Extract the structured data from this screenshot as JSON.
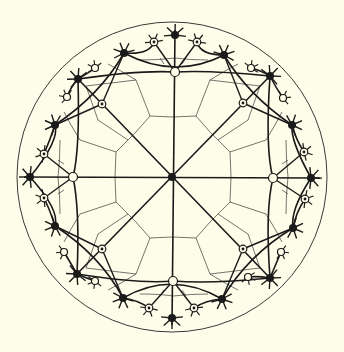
{
  "title": "Hyperbolic tiling in the Poincaré disk",
  "colors": {
    "background": "#fdfde9",
    "ink": "#1a1a1a",
    "thin_line": "#3a3a3a",
    "white_node": "#fdfde9"
  },
  "disk": {
    "cx": 172,
    "cy": 177,
    "r": 155
  },
  "center_node": {
    "x": 172,
    "y": 177,
    "type": "black"
  },
  "axis_lines": [
    {
      "x1": 175,
      "y1": 30,
      "x2": 172,
      "y2": 325
    },
    {
      "x1": 24,
      "y1": 177,
      "x2": 320,
      "y2": 178
    },
    {
      "x1": 78,
      "y1": 79,
      "x2": 270,
      "y2": 278
    },
    {
      "x1": 270,
      "y1": 76,
      "x2": 77,
      "y2": 274
    }
  ],
  "geodesic_arcs": [
    {
      "d": "M 124 53 Q 175 80 224 55"
    },
    {
      "d": "M 55 125 Q 100 95 124 53"
    },
    {
      "d": "M 224 55 Q 248 95 292 125"
    },
    {
      "d": "M 30 177 Q 60 140 55 125"
    },
    {
      "d": "M 292 125 Q 290 140 311 178"
    },
    {
      "d": "M 55 226 Q 60 210 30 177"
    },
    {
      "d": "M 311 178 Q 290 210 293 228"
    },
    {
      "d": "M 123 298 Q 100 255 55 226"
    },
    {
      "d": "M 293 228 Q 248 255 222 299"
    },
    {
      "d": "M 222 299 Q 172 270 123 298"
    },
    {
      "d": "M 78 79 Q 80 150 73 177"
    },
    {
      "d": "M 73 177 Q 80 210 77 274"
    },
    {
      "d": "M 270 76 Q 265 150 273 178"
    },
    {
      "d": "M 273 178 Q 265 210 270 278"
    },
    {
      "d": "M 78 79 Q 140 70 175 72"
    },
    {
      "d": "M 175 72 Q 210 70 270 76"
    },
    {
      "d": "M 77 274 Q 140 284 173 281"
    },
    {
      "d": "M 173 281 Q 210 284 270 278"
    },
    {
      "d": "M 154 42 Q 150 55 124 53"
    },
    {
      "d": "M 197 42 Q 200 55 224 55"
    },
    {
      "d": "M 44 154 Q 50 140 55 125"
    },
    {
      "d": "M 44 198 Q 50 210 55 226"
    },
    {
      "d": "M 304 152 Q 296 140 292 125"
    },
    {
      "d": "M 305 199 Q 296 212 293 228"
    },
    {
      "d": "M 149 308 Q 138 300 123 298"
    },
    {
      "d": "M 194 308 Q 206 300 222 299"
    },
    {
      "d": "M 95 68 Q 90 72 78 79"
    },
    {
      "d": "M 67 97 Q 70 88 78 79"
    },
    {
      "d": "M 251 68 Q 260 70 270 76"
    },
    {
      "d": "M 283 98 Q 276 88 270 76"
    },
    {
      "d": "M 64 252 Q 70 262 77 274"
    },
    {
      "d": "M 95 281 Q 86 278 77 274"
    },
    {
      "d": "M 248 277 Q 258 276 270 278"
    },
    {
      "d": "M 281 252 Q 276 264 270 278"
    }
  ],
  "spokes_to_ring": [
    {
      "x1": 102,
      "y1": 104,
      "x2": 124,
      "y2": 53
    },
    {
      "x1": 102,
      "y1": 104,
      "x2": 55,
      "y2": 125
    },
    {
      "x1": 243,
      "y1": 103,
      "x2": 224,
      "y2": 55
    },
    {
      "x1": 243,
      "y1": 103,
      "x2": 292,
      "y2": 125
    },
    {
      "x1": 102,
      "y1": 249,
      "x2": 55,
      "y2": 226
    },
    {
      "x1": 102,
      "y1": 249,
      "x2": 123,
      "y2": 298
    },
    {
      "x1": 243,
      "y1": 249,
      "x2": 293,
      "y2": 228
    },
    {
      "x1": 243,
      "y1": 249,
      "x2": 222,
      "y2": 299
    },
    {
      "x1": 175,
      "y1": 72,
      "x2": 154,
      "y2": 42
    },
    {
      "x1": 175,
      "y1": 72,
      "x2": 197,
      "y2": 42
    },
    {
      "x1": 73,
      "y1": 177,
      "x2": 44,
      "y2": 154
    },
    {
      "x1": 73,
      "y1": 177,
      "x2": 44,
      "y2": 198
    },
    {
      "x1": 273,
      "y1": 178,
      "x2": 304,
      "y2": 152
    },
    {
      "x1": 273,
      "y1": 178,
      "x2": 305,
      "y2": 199
    },
    {
      "x1": 173,
      "y1": 281,
      "x2": 149,
      "y2": 308
    },
    {
      "x1": 173,
      "y1": 281,
      "x2": 194,
      "y2": 308
    }
  ],
  "inner_cells": [
    {
      "d": "M 150 116 Q 172 118 196 116"
    },
    {
      "d": "M 150 116 L 136 132 M 196 116 L 210 132"
    },
    {
      "d": "M 116 152 Q 114 177 116 202"
    },
    {
      "d": "M 116 152 L 128 140 M 116 202 L 128 214"
    },
    {
      "d": "M 230 152 Q 232 177 230 202"
    },
    {
      "d": "M 230 152 L 218 140 M 230 202 L 218 214"
    },
    {
      "d": "M 150 238 Q 172 236 196 238"
    },
    {
      "d": "M 150 238 L 136 222 M 196 238 L 210 222"
    },
    {
      "d": "M 136 132 L 128 140 M 210 132 L 218 140 M 128 214 L 136 222 M 218 214 L 210 222"
    },
    {
      "d": "M 136 80 L 150 116 M 210 80 L 196 116"
    },
    {
      "d": "M 80 140 L 116 152 M 80 214 L 116 202"
    },
    {
      "d": "M 266 140 L 230 152 M 266 214 L 230 202"
    },
    {
      "d": "M 136 274 L 150 238 M 210 274 L 196 238"
    },
    {
      "d": "M 98 120 L 128 140 M 248 120 L 218 140 M 98 234 L 128 214 M 248 234 L 218 214"
    },
    {
      "d": "M 136 80 Q 120 70 108 64 M 210 80 Q 226 70 238 64"
    },
    {
      "d": "M 80 140 Q 70 124 64 112 M 80 214 Q 70 230 64 242"
    },
    {
      "d": "M 266 140 Q 276 124 282 112 M 266 214 Q 276 230 282 242"
    },
    {
      "d": "M 136 274 Q 120 284 108 290 M 210 274 Q 226 284 238 290"
    },
    {
      "d": "M 160 58 L 164 64 M 186 58 L 182 64 M 58 160 L 64 164 M 58 194 L 64 190"
    },
    {
      "d": "M 288 160 L 282 164 M 288 194 L 282 190 M 160 296 L 164 290 M 186 296 L 182 290"
    },
    {
      "d": "M 140 60 Q 160 60 175 58 Q 190 60 208 60"
    },
    {
      "d": "M 60 140 Q 60 160 58 177 Q 60 194 60 214"
    },
    {
      "d": "M 286 140 Q 286 160 288 177 Q 286 194 286 214"
    },
    {
      "d": "M 140 294 Q 160 294 173 296 Q 190 294 208 294"
    },
    {
      "d": "M 86 86 L 98 120 M 86 86 L 136 80"
    },
    {
      "d": "M 260 86 L 248 120 M 260 86 L 210 80"
    },
    {
      "d": "M 86 268 L 98 234 M 86 268 L 136 274"
    },
    {
      "d": "M 260 268 L 248 234 M 260 268 L 210 274"
    }
  ],
  "ring_black_nodes": [
    {
      "x": 175,
      "y": 35
    },
    {
      "x": 30,
      "y": 177
    },
    {
      "x": 311,
      "y": 178
    },
    {
      "x": 172,
      "y": 318
    },
    {
      "x": 124,
      "y": 53
    },
    {
      "x": 224,
      "y": 55
    },
    {
      "x": 78,
      "y": 79
    },
    {
      "x": 270,
      "y": 76
    },
    {
      "x": 55,
      "y": 125
    },
    {
      "x": 292,
      "y": 125
    },
    {
      "x": 55,
      "y": 226
    },
    {
      "x": 293,
      "y": 228
    },
    {
      "x": 77,
      "y": 274
    },
    {
      "x": 270,
      "y": 278
    },
    {
      "x": 123,
      "y": 298
    },
    {
      "x": 222,
      "y": 299
    }
  ],
  "white_nodes": [
    {
      "x": 175,
      "y": 72
    },
    {
      "x": 73,
      "y": 177
    },
    {
      "x": 273,
      "y": 178
    },
    {
      "x": 173,
      "y": 281
    },
    {
      "x": 95,
      "y": 68
    },
    {
      "x": 67,
      "y": 97
    },
    {
      "x": 251,
      "y": 68
    },
    {
      "x": 283,
      "y": 98
    },
    {
      "x": 64,
      "y": 252
    },
    {
      "x": 95,
      "y": 281
    },
    {
      "x": 248,
      "y": 277
    },
    {
      "x": 281,
      "y": 252
    }
  ],
  "dot_nodes": [
    {
      "x": 102,
      "y": 104
    },
    {
      "x": 243,
      "y": 103
    },
    {
      "x": 102,
      "y": 249
    },
    {
      "x": 243,
      "y": 249
    },
    {
      "x": 154,
      "y": 42
    },
    {
      "x": 197,
      "y": 42
    },
    {
      "x": 44,
      "y": 154
    },
    {
      "x": 44,
      "y": 198
    },
    {
      "x": 304,
      "y": 152
    },
    {
      "x": 305,
      "y": 199
    },
    {
      "x": 149,
      "y": 308
    },
    {
      "x": 194,
      "y": 308
    }
  ]
}
